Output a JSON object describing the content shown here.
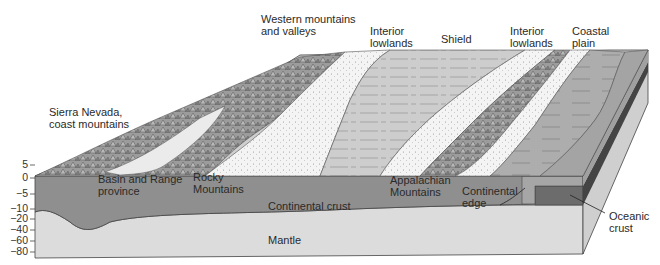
{
  "surface_labels": {
    "sierra": "Sierra Nevada,\ncoast mountains",
    "western": "Western mountains\nand valleys",
    "interior_left": "Interior\nlowlands",
    "shield": "Shield",
    "interior_right": "Interior\nlowlands",
    "coastal": "Coastal\nplain"
  },
  "front_labels": {
    "basin": "Basin and Range\nprovince",
    "rocky": "Rocky\nMountains",
    "appalachian": "Appalachian\nMountains",
    "continental_edge": "Continental\nedge",
    "continental_crust": "Continental crust",
    "mantle": "Mantle",
    "oceanic_crust": "Oceanic\ncrust"
  },
  "depth_axis": {
    "ticks": [
      "5",
      "0",
      "−5",
      "−10",
      "−20",
      "−40",
      "−60",
      "−80"
    ]
  },
  "colors": {
    "crust": "#8e8e8e",
    "mantle": "#dadada",
    "oceanic": "#6b6b6b",
    "mountains": "#9a9a9a",
    "lowlands": "#f2f2f2",
    "shield": "#c8c8c8",
    "coastal": "#a8a8a8",
    "outline": "#444444"
  }
}
